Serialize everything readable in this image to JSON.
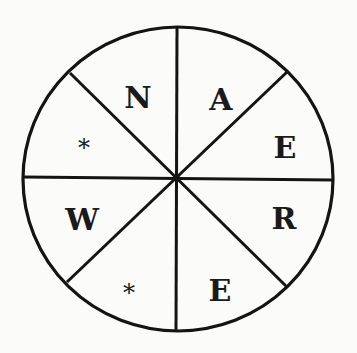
{
  "puzzle": {
    "type": "word-wheel",
    "segment_count": 8,
    "reading_order": "clockwise from top",
    "segments": [
      {
        "position": "top-right-upper",
        "label": "A",
        "blank": false
      },
      {
        "position": "right-upper",
        "label": "E",
        "blank": false
      },
      {
        "position": "right-lower",
        "label": "R",
        "blank": false
      },
      {
        "position": "bottom-right",
        "label": "E",
        "blank": false
      },
      {
        "position": "bottom-left",
        "label": "*",
        "blank": true
      },
      {
        "position": "left-lower",
        "label": "W",
        "blank": false
      },
      {
        "position": "left-upper",
        "label": "*",
        "blank": true
      },
      {
        "position": "top-left-upper",
        "label": "N",
        "blank": false
      }
    ],
    "colors": {
      "line": "#141414",
      "text": "#1a1a1a",
      "background": "#fbfbf9"
    }
  }
}
